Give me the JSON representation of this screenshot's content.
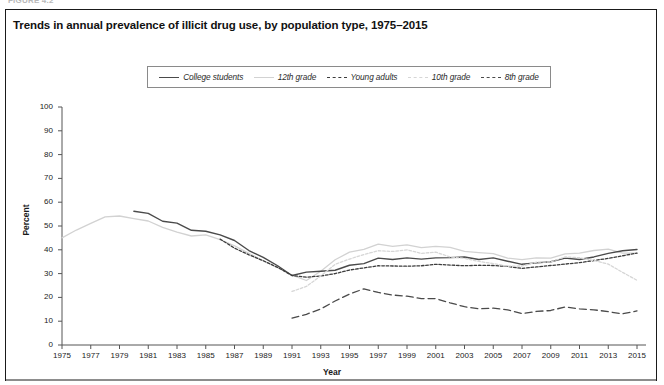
{
  "figure": {
    "caption_faint": "FIGURE 4.2",
    "title": "Trends in annual prevalence of illicit drug use, by population type, 1975–2015"
  },
  "legend": {
    "position": "top-center",
    "items": [
      {
        "label": "College students",
        "style": "solid",
        "color": "#4a4a4a",
        "width": 1.4
      },
      {
        "label": "12th grade",
        "style": "solid",
        "color": "#d2d2d2",
        "width": 1.4
      },
      {
        "label": "Young adults",
        "style": "dotted",
        "color": "#3c3c3c",
        "width": 1.3
      },
      {
        "label": "10th grade",
        "style": "dotted",
        "color": "#d6d6d6",
        "width": 1.3
      },
      {
        "label": "8th grade",
        "style": "dashed",
        "color": "#4a4a4a",
        "width": 1.3
      }
    ]
  },
  "axes": {
    "y": {
      "label": "Percent",
      "min": 0,
      "max": 100,
      "step": 10,
      "ticks": [
        0,
        10,
        20,
        30,
        40,
        50,
        60,
        70,
        80,
        90,
        100
      ]
    },
    "x": {
      "label": "Year",
      "min": 1975,
      "max": 2015,
      "step": 2,
      "ticks": [
        1975,
        1977,
        1979,
        1981,
        1983,
        1985,
        1987,
        1989,
        1991,
        1993,
        1995,
        1997,
        1999,
        2001,
        2003,
        2005,
        2007,
        2009,
        2011,
        2013,
        2015
      ]
    }
  },
  "chart_data": {
    "type": "line",
    "title": "Trends in annual prevalence of illicit drug use, by population type, 1975–2015",
    "xlabel": "Year",
    "ylabel": "Percent",
    "xlim": [
      1975,
      2015
    ],
    "ylim": [
      0,
      100
    ],
    "grid": false,
    "legend_position": "top-center",
    "x": [
      1975,
      1976,
      1977,
      1978,
      1979,
      1980,
      1981,
      1982,
      1983,
      1984,
      1985,
      1986,
      1987,
      1988,
      1989,
      1990,
      1991,
      1992,
      1993,
      1994,
      1995,
      1996,
      1997,
      1998,
      1999,
      2000,
      2001,
      2002,
      2003,
      2004,
      2005,
      2006,
      2007,
      2008,
      2009,
      2010,
      2011,
      2012,
      2013,
      2014,
      2015
    ],
    "series": [
      {
        "name": "12th grade",
        "style": "solid",
        "color": "#d2d2d2",
        "start_year": 1975,
        "values": [
          45.0,
          48.3,
          51.1,
          53.8,
          54.2,
          53.1,
          52.1,
          49.4,
          47.4,
          45.8,
          46.3,
          44.3,
          41.7,
          38.5,
          35.4,
          32.5,
          29.4,
          27.1,
          31.0,
          35.8,
          39.0,
          40.2,
          42.4,
          41.4,
          42.1,
          40.9,
          41.4,
          41.0,
          39.3,
          38.8,
          38.4,
          36.5,
          35.9,
          36.6,
          36.5,
          38.3,
          38.6,
          39.7,
          40.3,
          38.6,
          38.6
        ]
      },
      {
        "name": "College students",
        "style": "solid",
        "color": "#4a4a4a",
        "start_year": 1980,
        "values": [
          null,
          null,
          null,
          null,
          null,
          56.2,
          55.3,
          52.0,
          51.2,
          48.2,
          47.8,
          46.3,
          43.9,
          39.7,
          36.8,
          33.3,
          29.2,
          30.6,
          31.0,
          31.4,
          33.5,
          34.2,
          36.5,
          35.9,
          36.6,
          36.1,
          36.6,
          36.7,
          37.0,
          35.9,
          36.6,
          35.2,
          33.9,
          34.5,
          35.0,
          36.5,
          35.9,
          37.0,
          38.5,
          39.6,
          40.1
        ]
      },
      {
        "name": "Young adults",
        "style": "dotted",
        "color": "#3c3c3c",
        "start_year": 1986,
        "values": [
          null,
          null,
          null,
          null,
          null,
          null,
          null,
          null,
          null,
          null,
          null,
          44.5,
          40.7,
          37.9,
          35.4,
          32.6,
          29.2,
          28.5,
          29.0,
          30.0,
          31.5,
          32.4,
          33.3,
          33.2,
          33.1,
          33.3,
          33.9,
          33.6,
          33.3,
          33.5,
          33.4,
          33.0,
          32.2,
          32.8,
          33.4,
          34.0,
          34.6,
          35.5,
          36.4,
          37.5,
          38.6
        ]
      },
      {
        "name": "10th grade",
        "style": "dotted",
        "color": "#d6d6d6",
        "start_year": 1991,
        "values": [
          null,
          null,
          null,
          null,
          null,
          null,
          null,
          null,
          null,
          null,
          null,
          null,
          null,
          null,
          null,
          null,
          22.5,
          24.6,
          29.0,
          33.9,
          36.1,
          38.0,
          39.6,
          39.3,
          40.0,
          38.5,
          39.0,
          37.0,
          36.4,
          35.1,
          34.2,
          33.1,
          33.2,
          34.8,
          34.9,
          37.0,
          36.7,
          35.5,
          34.0,
          30.5,
          27.2
        ]
      },
      {
        "name": "8th grade",
        "style": "dashed",
        "color": "#4a4a4a",
        "start_year": 1991,
        "values": [
          null,
          null,
          null,
          null,
          null,
          null,
          null,
          null,
          null,
          null,
          null,
          null,
          null,
          null,
          null,
          null,
          11.3,
          12.9,
          15.1,
          18.5,
          21.4,
          23.6,
          22.1,
          21.0,
          20.5,
          19.5,
          19.5,
          17.7,
          16.1,
          15.2,
          15.5,
          14.8,
          13.2,
          14.1,
          14.5,
          16.0,
          15.2,
          14.8,
          14.0,
          13.1,
          14.3
        ]
      }
    ]
  }
}
